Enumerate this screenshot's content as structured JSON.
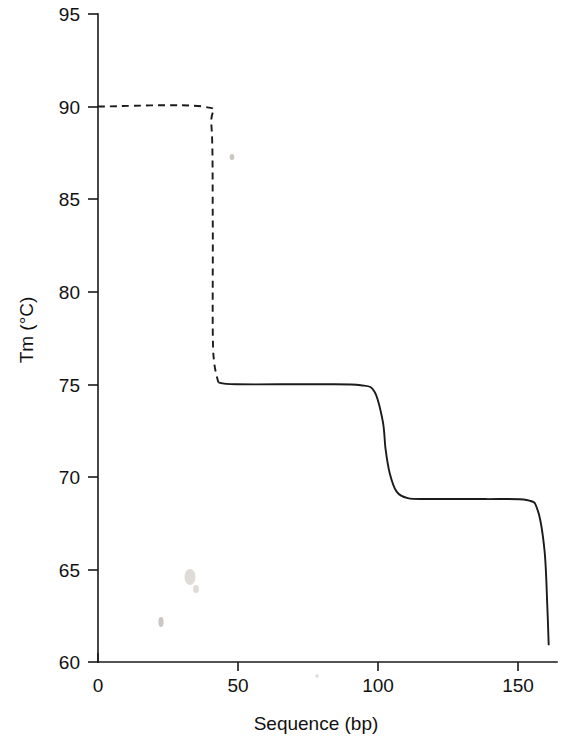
{
  "figure": {
    "title": "",
    "background_color": "#ffffff",
    "line_color": "#1b1b1b"
  },
  "chart_data": {
    "type": "line",
    "title": "",
    "subtitle": "",
    "xlabel": "Sequence (bp)",
    "ylabel": "Tm (°C)",
    "xlim": [
      0,
      166
    ],
    "ylim": [
      60,
      95
    ],
    "grid": false,
    "legend": null,
    "x_ticks": [
      0,
      50,
      100,
      150
    ],
    "x_tick_labels": [
      "0",
      "50",
      "100",
      "150"
    ],
    "y_ticks": [
      60,
      65,
      70,
      75,
      80,
      85,
      90,
      95
    ],
    "y_tick_labels": [
      "60",
      "65",
      "70",
      "75",
      "80",
      "85",
      "90",
      "95"
    ],
    "series": [
      {
        "name": "Tm profile (dashed domain)",
        "style": "dashed",
        "points": [
          {
            "x": 0,
            "y": 90.0
          },
          {
            "x": 38,
            "y": 90.0
          },
          {
            "x": 41,
            "y": 89.0
          },
          {
            "x": 41.5,
            "y": 84.0
          },
          {
            "x": 41.5,
            "y": 78.0
          },
          {
            "x": 42,
            "y": 76.2
          },
          {
            "x": 43.5,
            "y": 75.1
          }
        ]
      },
      {
        "name": "Tm profile (solid domains)",
        "style": "solid",
        "points": [
          {
            "x": 43.5,
            "y": 75.1
          },
          {
            "x": 50,
            "y": 75.0
          },
          {
            "x": 80,
            "y": 75.0
          },
          {
            "x": 95,
            "y": 74.95
          },
          {
            "x": 100,
            "y": 74.6
          },
          {
            "x": 103,
            "y": 73.0
          },
          {
            "x": 104,
            "y": 71.5
          },
          {
            "x": 105.5,
            "y": 70.2
          },
          {
            "x": 108,
            "y": 69.2
          },
          {
            "x": 112,
            "y": 68.85
          },
          {
            "x": 120,
            "y": 68.8
          },
          {
            "x": 140,
            "y": 68.8
          },
          {
            "x": 155,
            "y": 68.75
          },
          {
            "x": 159,
            "y": 68.2
          },
          {
            "x": 161.5,
            "y": 66.0
          },
          {
            "x": 162.5,
            "y": 63.0
          },
          {
            "x": 163,
            "y": 60.9
          }
        ]
      }
    ],
    "plateaus": [
      {
        "domain_index": 1,
        "tm": 90.0,
        "x_start": 0,
        "x_end": 41,
        "line_style": "dashed"
      },
      {
        "domain_index": 2,
        "tm": 75.0,
        "x_start": 44,
        "x_end": 100,
        "line_style": "solid"
      },
      {
        "domain_index": 3,
        "tm": 68.8,
        "x_start": 112,
        "x_end": 157,
        "line_style": "solid"
      }
    ],
    "transitions": [
      {
        "from_tm": 90.0,
        "to_tm": 75.0,
        "x_center": 41.5,
        "line_style": "dashed"
      },
      {
        "from_tm": 75.0,
        "to_tm": 68.8,
        "x_center": 104.5,
        "line_style": "solid"
      },
      {
        "from_tm": 68.8,
        "to_tm": 60.9,
        "x_center": 162.0,
        "line_style": "solid"
      }
    ]
  },
  "axes": {
    "y_axis_title": "Tm (°C)",
    "x_axis_title": "Sequence (bp)",
    "y_tick_labels": [
      "95",
      "90",
      "85",
      "80",
      "75",
      "70",
      "65",
      "60"
    ],
    "x_tick_labels": [
      "0",
      "50",
      "100",
      "150"
    ]
  }
}
